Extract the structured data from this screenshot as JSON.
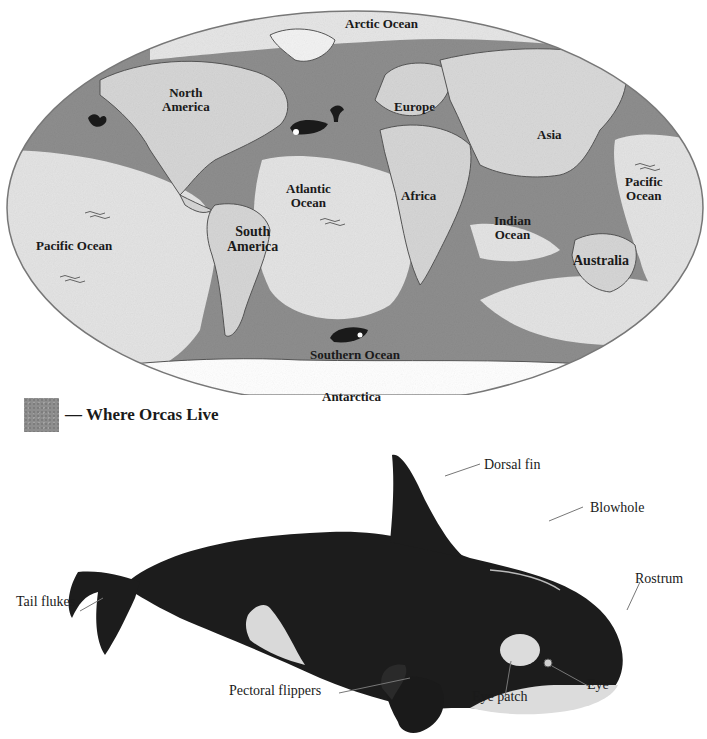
{
  "map": {
    "labels": {
      "arctic_ocean": "Arctic Ocean",
      "north_america": "North\nAmerica",
      "europe": "Europe",
      "asia": "Asia",
      "atlantic_ocean": "Atlantic\nOcean",
      "africa": "Africa",
      "pacific_ocean_west": "Pacific Ocean",
      "south_america": "South\nAmerica",
      "indian_ocean": "Indian\nOcean",
      "pacific_ocean_east": "Pacific\nOcean",
      "australia": "Australia",
      "southern_ocean": "Southern Ocean",
      "antarctica": "Antarctica"
    },
    "colors": {
      "land": "#d9d9d9",
      "open_ocean": "#e6e6e6",
      "orca_habitat": "#8e8e8e",
      "outline": "#555555"
    }
  },
  "legend": {
    "text": "— Where Orcas Live"
  },
  "orca": {
    "labels": {
      "dorsal_fin": "Dorsal fin",
      "blowhole": "Blowhole",
      "rostrum": "Rostrum",
      "tail_flukes": "Tail flukes",
      "pectoral_flippers": "Pectoral flippers",
      "eye_patch": "Eye patch",
      "eye": "Eye"
    }
  }
}
